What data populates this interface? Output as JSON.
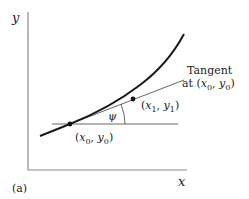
{
  "diagram": {
    "panel_label": "(a)",
    "axes": {
      "x_label": "x",
      "y_label": "y"
    },
    "tangent_label": {
      "line1": "Tangent",
      "line2_prefix": "at (",
      "x": "x",
      "x_sub": "0",
      "sep": ", ",
      "y": "y",
      "y_sub": "0",
      "close": ")"
    },
    "point0": {
      "open": "(",
      "x": "x",
      "x_sub": "0",
      "sep": ", ",
      "y": "y",
      "y_sub": "0",
      "close": ")"
    },
    "point1": {
      "open": "(",
      "x": "x",
      "x_sub": "1",
      "sep": ", ",
      "y": "y",
      "y_sub": "1",
      "close": ")"
    },
    "angle_label": "ψ",
    "colors": {
      "curve": "#1a1a1a",
      "axis": "#8a8a8a",
      "line": "#555555",
      "text": "#222222"
    }
  }
}
